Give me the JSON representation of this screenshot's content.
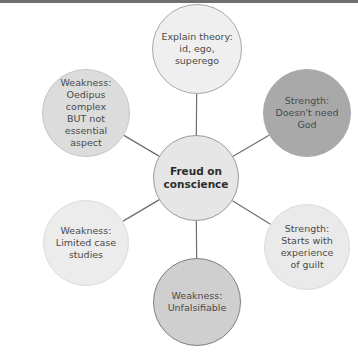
{
  "diagram": {
    "title": "Freud on conscience",
    "center": {
      "label": "Freud on\nconscience",
      "fill": "#e6e6e6",
      "border": "#9a9a9a",
      "cx": 196,
      "cy": 178,
      "r": 43
    },
    "nodes": [
      {
        "id": "top",
        "label": "Explain theory:\nid, ego, superego",
        "fill": "#efefef",
        "border": "#a8a8a8",
        "cx": 197,
        "cy": 49,
        "r": 45
      },
      {
        "id": "top-right",
        "label": "Strength:\nDoesn't need God",
        "fill": "#a9a9a9",
        "border": "#a9a9a9",
        "cx": 307,
        "cy": 113,
        "r": 44
      },
      {
        "id": "bottom-right",
        "label": "Strength:\nStarts with\nexperience\nof guilt",
        "fill": "#eaeaea",
        "border": "#dadada",
        "cx": 307,
        "cy": 247,
        "r": 43
      },
      {
        "id": "bottom",
        "label": "Weakness:\nUnfalsifiable",
        "fill": "#cfcfcf",
        "border": "#7f7f7f",
        "cx": 197,
        "cy": 302,
        "r": 44
      },
      {
        "id": "bottom-left",
        "label": "Weakness:\nLimited case\nstudies",
        "fill": "#ececec",
        "border": "#dcdcdc",
        "cx": 86,
        "cy": 243,
        "r": 43
      },
      {
        "id": "top-left",
        "label": "Weakness:\nOedipus complex\nBUT not essential\naspect",
        "fill": "#dcdcdc",
        "border": "#c6c6c6",
        "cx": 86,
        "cy": 113,
        "r": 44
      }
    ],
    "link_color": "#6e6e6e"
  }
}
